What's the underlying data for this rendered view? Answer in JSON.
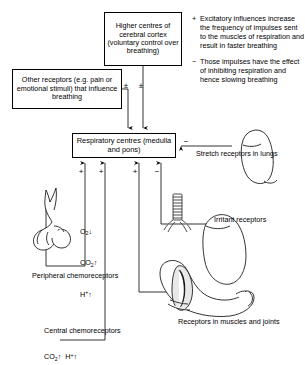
{
  "diagram": {
    "boxes": {
      "higher_centres": "Higher centres of cerebral cortex (voluntary control over breathing)",
      "other_receptors": "Other receptors (e.g. pain or emotional stimuli) that influence breathing",
      "respiratory_centres": "Respiratory centres (medulla and pons)"
    },
    "legend": [
      {
        "symbol": "+",
        "text": "Excitatory influences increase the frequency of impulses sent to the muscles of respiration and result in faster breathing"
      },
      {
        "symbol": "−",
        "text": "Those impulses have the effect of inhibiting respiration and hence slowing breathing"
      }
    ],
    "labels": {
      "stretch_receptors": "Stretch receptors in lungs",
      "irritant_receptors": "Irritant receptors",
      "muscle_receptors": "Receptors in muscles and joints",
      "peripheral_chemoreceptors": "Peripheral chemoreceptors",
      "central_chemoreceptors": "Central chemoreceptors"
    },
    "chemoreceptor_values": {
      "peripheral": [
        "O2↓",
        "CO2↑",
        "H+↑"
      ],
      "central": "CO2↑  H+↑"
    },
    "signs": {
      "higher_centres_input": "±",
      "other_receptors_input": "±",
      "stretch_input": "−",
      "bottom_inputs": [
        "+",
        "+",
        "+",
        "−"
      ]
    },
    "colors": {
      "stroke": "#000000",
      "background": "#ffffff"
    }
  }
}
